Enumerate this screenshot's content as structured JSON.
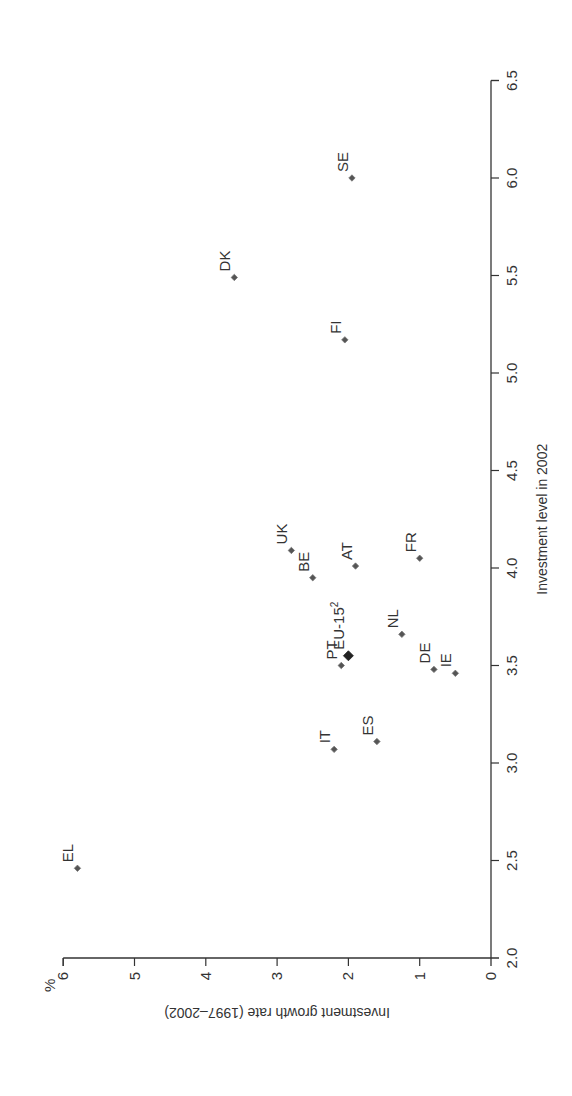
{
  "chart_data": {
    "type": "scatter",
    "title": "",
    "xlabel": "Investment level in 2002",
    "ylabel": "Investment growth rate (1997–2002)",
    "y_unit": "%",
    "xlim": [
      2.0,
      6.5
    ],
    "ylim": [
      0,
      6
    ],
    "x_ticks": [
      "2.0",
      "2.5",
      "3.0",
      "3.5",
      "4.0",
      "4.5",
      "5.0",
      "5.5",
      "6.0",
      "6.5"
    ],
    "y_ticks": [
      "0",
      "1",
      "2",
      "3",
      "4",
      "5",
      "6"
    ],
    "grid": false,
    "orientation": "rotated 90° counter-clockwise",
    "points": [
      {
        "label": "EL",
        "x": 2.46,
        "y": 5.8
      },
      {
        "label": "IT",
        "x": 3.07,
        "y": 2.2
      },
      {
        "label": "ES",
        "x": 3.11,
        "y": 1.6
      },
      {
        "label": "IE",
        "x": 3.46,
        "y": 0.5
      },
      {
        "label": "DE",
        "x": 3.48,
        "y": 0.8
      },
      {
        "label": "PT",
        "x": 3.5,
        "y": 2.1
      },
      {
        "label": "EU-15",
        "sup": "2",
        "x": 3.55,
        "y": 2.0,
        "highlight": true
      },
      {
        "label": "NL",
        "x": 3.66,
        "y": 1.25
      },
      {
        "label": "BE",
        "x": 3.95,
        "y": 2.5
      },
      {
        "label": "AT",
        "x": 4.01,
        "y": 1.9
      },
      {
        "label": "FR",
        "x": 4.05,
        "y": 1.0
      },
      {
        "label": "UK",
        "x": 4.09,
        "y": 2.8
      },
      {
        "label": "FI",
        "x": 5.17,
        "y": 2.05
      },
      {
        "label": "DK",
        "x": 5.49,
        "y": 3.6
      },
      {
        "label": "SE",
        "x": 6.0,
        "y": 1.95
      }
    ]
  },
  "colors": {
    "marker": "#555555",
    "marker_highlight": "#222222",
    "axis": "#333333",
    "text": "#333333"
  }
}
